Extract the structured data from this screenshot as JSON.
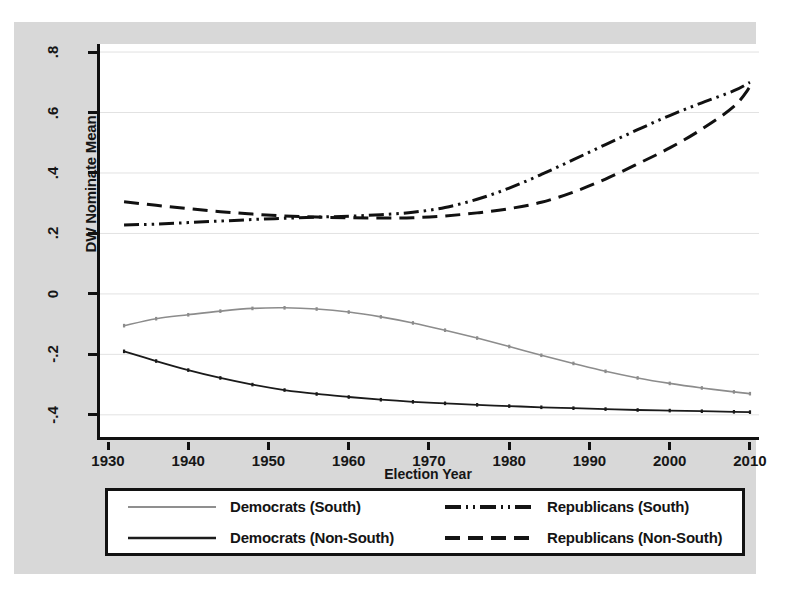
{
  "chart_data": {
    "type": "line",
    "title": "",
    "xlabel": "Election Year",
    "ylabel": "DW Nominate Mean",
    "xlim": [
      1930,
      2011
    ],
    "ylim": [
      -0.47,
      0.82
    ],
    "xticks": [
      1930,
      1940,
      1950,
      1960,
      1970,
      1980,
      1990,
      2000,
      2010
    ],
    "xtick_labels": [
      "1930",
      "1940",
      "1950",
      "1960",
      "1970",
      "1980",
      "1990",
      "2000",
      "2010"
    ],
    "yticks": [
      0.8,
      0.6,
      0.4,
      0.2,
      0,
      -0.2,
      -0.4
    ],
    "ytick_labels": [
      ".8",
      ".6",
      ".4",
      ".2",
      "0",
      "-.2",
      "-.4"
    ],
    "grid": "horizontal",
    "legend_position": "below",
    "x": [
      1932,
      1936,
      1940,
      1944,
      1948,
      1952,
      1956,
      1960,
      1964,
      1968,
      1972,
      1976,
      1980,
      1984,
      1988,
      1992,
      1996,
      2000,
      2004,
      2008,
      2010
    ],
    "series": [
      {
        "name": "Democrats (South)",
        "style": "solid",
        "color": "#8c8c8c",
        "width": 1.6,
        "values": [
          -0.105,
          -0.082,
          -0.069,
          -0.057,
          -0.048,
          -0.046,
          -0.05,
          -0.06,
          -0.076,
          -0.096,
          -0.12,
          -0.146,
          -0.174,
          -0.203,
          -0.23,
          -0.256,
          -0.278,
          -0.296,
          -0.311,
          -0.324,
          -0.33
        ]
      },
      {
        "name": "Democrats (Non-South)",
        "style": "solid",
        "color": "#1a1a1a",
        "width": 1.8,
        "values": [
          -0.19,
          -0.222,
          -0.252,
          -0.278,
          -0.3,
          -0.318,
          -0.331,
          -0.341,
          -0.35,
          -0.357,
          -0.362,
          -0.367,
          -0.371,
          -0.375,
          -0.378,
          -0.381,
          -0.384,
          -0.386,
          -0.388,
          -0.39,
          -0.391
        ]
      },
      {
        "name": "Republicans (South)",
        "style": "dash-dot-dot",
        "color": "#111111",
        "width": 3.0,
        "values": [
          0.228,
          0.231,
          0.236,
          0.241,
          0.246,
          0.25,
          0.254,
          0.257,
          0.262,
          0.27,
          0.286,
          0.313,
          0.35,
          0.395,
          0.444,
          0.494,
          0.543,
          0.59,
          0.632,
          0.672,
          0.7
        ]
      },
      {
        "name": "Republicans (Non-South)",
        "style": "dashed",
        "color": "#111111",
        "width": 3.0,
        "values": [
          0.305,
          0.293,
          0.282,
          0.272,
          0.264,
          0.258,
          0.254,
          0.252,
          0.251,
          0.252,
          0.258,
          0.268,
          0.282,
          0.303,
          0.337,
          0.38,
          0.43,
          0.483,
          0.545,
          0.62,
          0.685
        ]
      }
    ]
  },
  "axes": {
    "y_title": "DW Nominate Mean",
    "x_title": "Election Year"
  },
  "legend": {
    "items": [
      {
        "label": "Democrats (South)",
        "key": "solid-light-line-key"
      },
      {
        "label": "Republicans (South)",
        "key": "dash-dot-dot-line-key"
      },
      {
        "label": "Democrats (Non-South)",
        "key": "solid-dark-line-key"
      },
      {
        "label": "Republicans (Non-South)",
        "key": "dashed-line-key"
      }
    ]
  },
  "colors": {
    "page_background": "#d8d8d8",
    "plot_background": "#ffffff",
    "axis": "#111111",
    "grid": "#e2e2e2",
    "democrat_south": "#8c8c8c",
    "democrat_nonsouth": "#1a1a1a",
    "republican": "#111111"
  }
}
